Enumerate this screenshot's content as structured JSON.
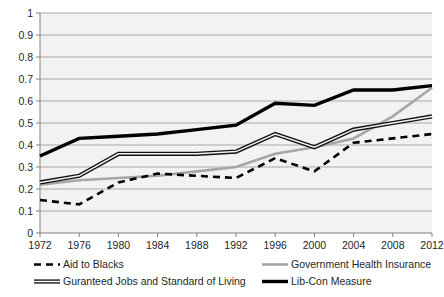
{
  "chart_data": {
    "type": "line",
    "title": "",
    "xlabel": "",
    "ylabel": "",
    "categories": [
      "1972",
      "1976",
      "1980",
      "1984",
      "1988",
      "1992",
      "1996",
      "2000",
      "2004",
      "2008",
      "2012"
    ],
    "x": [
      1972,
      1976,
      1980,
      1984,
      1988,
      1992,
      1996,
      2000,
      2004,
      2008,
      2012
    ],
    "ylim": [
      0,
      1
    ],
    "xlim": [
      1972,
      2012
    ],
    "ytick_labels": [
      "0",
      "0.1",
      "0.2",
      "0.3",
      "0.4",
      "0.5",
      "0.6",
      "0.7",
      "0.8",
      "0.9",
      "1"
    ],
    "ytick_values": [
      0,
      0.1,
      0.2,
      0.3,
      0.4,
      0.5,
      0.6,
      0.7,
      0.8,
      0.9,
      1
    ],
    "grid": true,
    "grid_axis": "y",
    "legend_position": "bottom",
    "plot_background": "#f2f2f2",
    "series": [
      {
        "name": "Aid to Blacks",
        "style": "dashed",
        "color": "#000000",
        "width": 2.6,
        "dash": "7,5",
        "values": [
          0.15,
          0.13,
          0.23,
          0.27,
          0.26,
          0.25,
          0.34,
          0.28,
          0.41,
          0.43,
          0.45
        ]
      },
      {
        "name": "Government Health Insurance",
        "style": "solid",
        "color": "#a6a6a6",
        "width": 2.6,
        "dash": "",
        "values": [
          0.22,
          0.24,
          0.25,
          0.26,
          0.28,
          0.3,
          0.36,
          0.39,
          0.43,
          0.53,
          0.66
        ]
      },
      {
        "name": "Guranteed Jobs and Standard of Living",
        "style": "double",
        "color": "#111111",
        "width": 1.3,
        "dash": "",
        "values": [
          0.23,
          0.26,
          0.36,
          0.36,
          0.36,
          0.37,
          0.45,
          0.39,
          0.47,
          0.5,
          0.53
        ]
      },
      {
        "name": "Lib-Con Measure",
        "style": "solid",
        "color": "#000000",
        "width": 3.4,
        "dash": "",
        "values": [
          0.35,
          0.43,
          0.44,
          0.45,
          0.47,
          0.49,
          0.59,
          0.58,
          0.65,
          0.65,
          0.67
        ]
      }
    ]
  },
  "legend": {
    "entries": [
      {
        "label": "Aid to Blacks",
        "series_index": 0
      },
      {
        "label": "Government Health Insurance",
        "series_index": 1
      },
      {
        "label": "Guranteed Jobs and Standard of Living",
        "series_index": 2
      },
      {
        "label": "Lib-Con Measure",
        "series_index": 3
      }
    ]
  }
}
